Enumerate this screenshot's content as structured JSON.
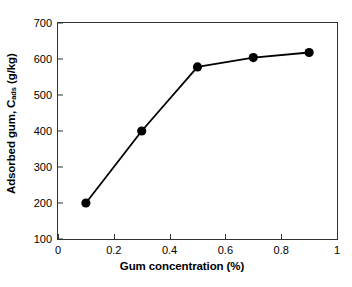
{
  "chart_data": {
    "type": "line",
    "title": "",
    "xlabel": "Gum concentration (%)",
    "ylabel_prefix": "Adsorbed gum, C",
    "ylabel_sub": "ads",
    "ylabel_suffix": " (g/kg)",
    "ylabel_plain": "Adsorbed gum, Cads (g/kg)",
    "x": [
      0.1,
      0.3,
      0.5,
      0.7,
      0.9
    ],
    "values": [
      200,
      400,
      578,
      604,
      618
    ],
    "series": [
      {
        "name": "Adsorbed gum",
        "x": [
          0.1,
          0.3,
          0.5,
          0.7,
          0.9
        ],
        "values": [
          200,
          400,
          578,
          604,
          618
        ],
        "marker": "filled-circle",
        "marker_color": "#000000",
        "line_color": "#000000"
      }
    ],
    "xlim": [
      0,
      1
    ],
    "ylim": [
      100,
      700
    ],
    "xticks": [
      0,
      0.2,
      0.4,
      0.6,
      0.8,
      1
    ],
    "xticklabels": [
      "0",
      "0.2",
      "0.4",
      "0.6",
      "0.8",
      "1"
    ],
    "yticks": [
      100,
      200,
      300,
      400,
      500,
      600,
      700
    ],
    "yticklabels": [
      "100",
      "200",
      "300",
      "400",
      "500",
      "600",
      "700"
    ],
    "grid": false,
    "legend": false,
    "legend_position": "none",
    "frame": true,
    "background_color": "#ffffff",
    "axis_color": "#333333"
  }
}
